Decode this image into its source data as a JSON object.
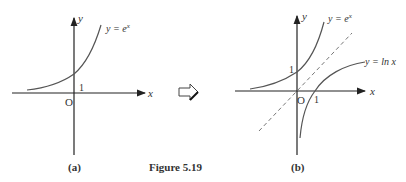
{
  "figure": {
    "caption": "Figure  5.19",
    "panel_a": {
      "label": "(a)",
      "axis_x": "x",
      "axis_y": "y",
      "origin": "O",
      "tick_y": "1",
      "curve_label": "y = e",
      "curve_label_exp": "x"
    },
    "panel_b": {
      "label": "(b)",
      "axis_x": "x",
      "axis_y": "y",
      "origin": "O",
      "tick_y": "1",
      "tick_x": "1",
      "curve1_label": "y = e",
      "curve1_label_exp": "x",
      "curve2_label": "y = ln  x"
    },
    "arrow": "right-outline-arrow",
    "colors": {
      "axis": "#222222",
      "curve": "#555555",
      "dashed": "#777777",
      "text": "#333333"
    }
  }
}
